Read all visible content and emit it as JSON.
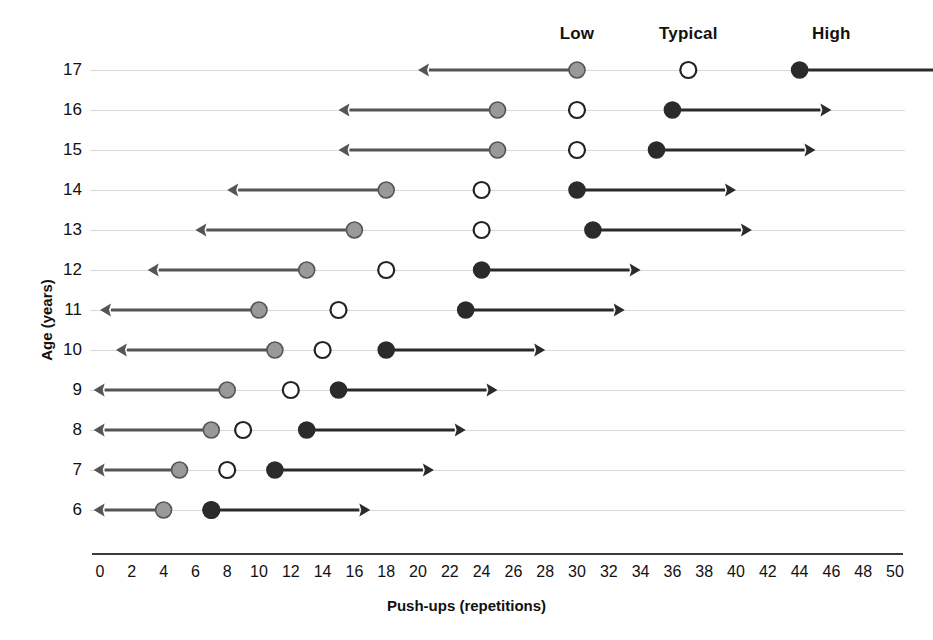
{
  "chart_data": {
    "type": "scatter",
    "title": "",
    "xlabel": "Push-ups (repetitions)",
    "ylabel": "Age (years)",
    "xlim": [
      0,
      50
    ],
    "ylim": [
      6,
      17
    ],
    "grid": true,
    "legend_position": "top",
    "x_ticks": [
      0,
      2,
      4,
      6,
      8,
      10,
      12,
      14,
      16,
      18,
      20,
      22,
      24,
      26,
      28,
      30,
      32,
      34,
      36,
      38,
      40,
      42,
      44,
      46,
      48,
      50
    ],
    "y_ticks": [
      17,
      16,
      15,
      14,
      13,
      12,
      11,
      10,
      9,
      8,
      7,
      6
    ],
    "column_headers": [
      {
        "label": "Low",
        "x_center": 30
      },
      {
        "label": "Typical",
        "x_center": 37
      },
      {
        "label": "High",
        "x_center": 46
      }
    ],
    "series": [
      {
        "name": "Low",
        "marker": "filled-gray-circle",
        "arrow": "left",
        "color": "#999999",
        "edge": "#555555",
        "values": [
          30,
          25,
          25,
          18,
          16,
          13,
          10,
          11,
          8,
          7,
          5,
          4
        ]
      },
      {
        "name": "Typical",
        "marker": "open-circle",
        "arrow": "none",
        "color": "#ffffff",
        "edge": "#222222",
        "values": [
          37,
          30,
          30,
          24,
          24,
          18,
          15,
          14,
          12,
          9,
          8,
          7
        ]
      },
      {
        "name": "High",
        "marker": "filled-black-circle",
        "arrow": "right",
        "color": "#2b2b2b",
        "edge": "#2b2b2b",
        "values": [
          44,
          36,
          35,
          30,
          31,
          24,
          23,
          18,
          15,
          13,
          11,
          7
        ]
      }
    ],
    "categories": [
      17,
      16,
      15,
      14,
      13,
      12,
      11,
      10,
      9,
      8,
      7,
      6
    ],
    "annotations": []
  },
  "colors": {
    "gridline": "#d8d8d8",
    "axis": "#3a3a3a",
    "low_marker": "#999999",
    "low_marker_edge": "#555555",
    "typical_marker": "#ffffff",
    "typical_marker_edge": "#222222",
    "high_marker": "#2b2b2b",
    "text": "#111111"
  },
  "geometry": {
    "x0_px": 100,
    "x50_px": 895,
    "row_top_px": 70,
    "row_step_px": 40,
    "axis_y_px": 553,
    "arrow_span_units": 10,
    "dot_radius_px": 8
  }
}
